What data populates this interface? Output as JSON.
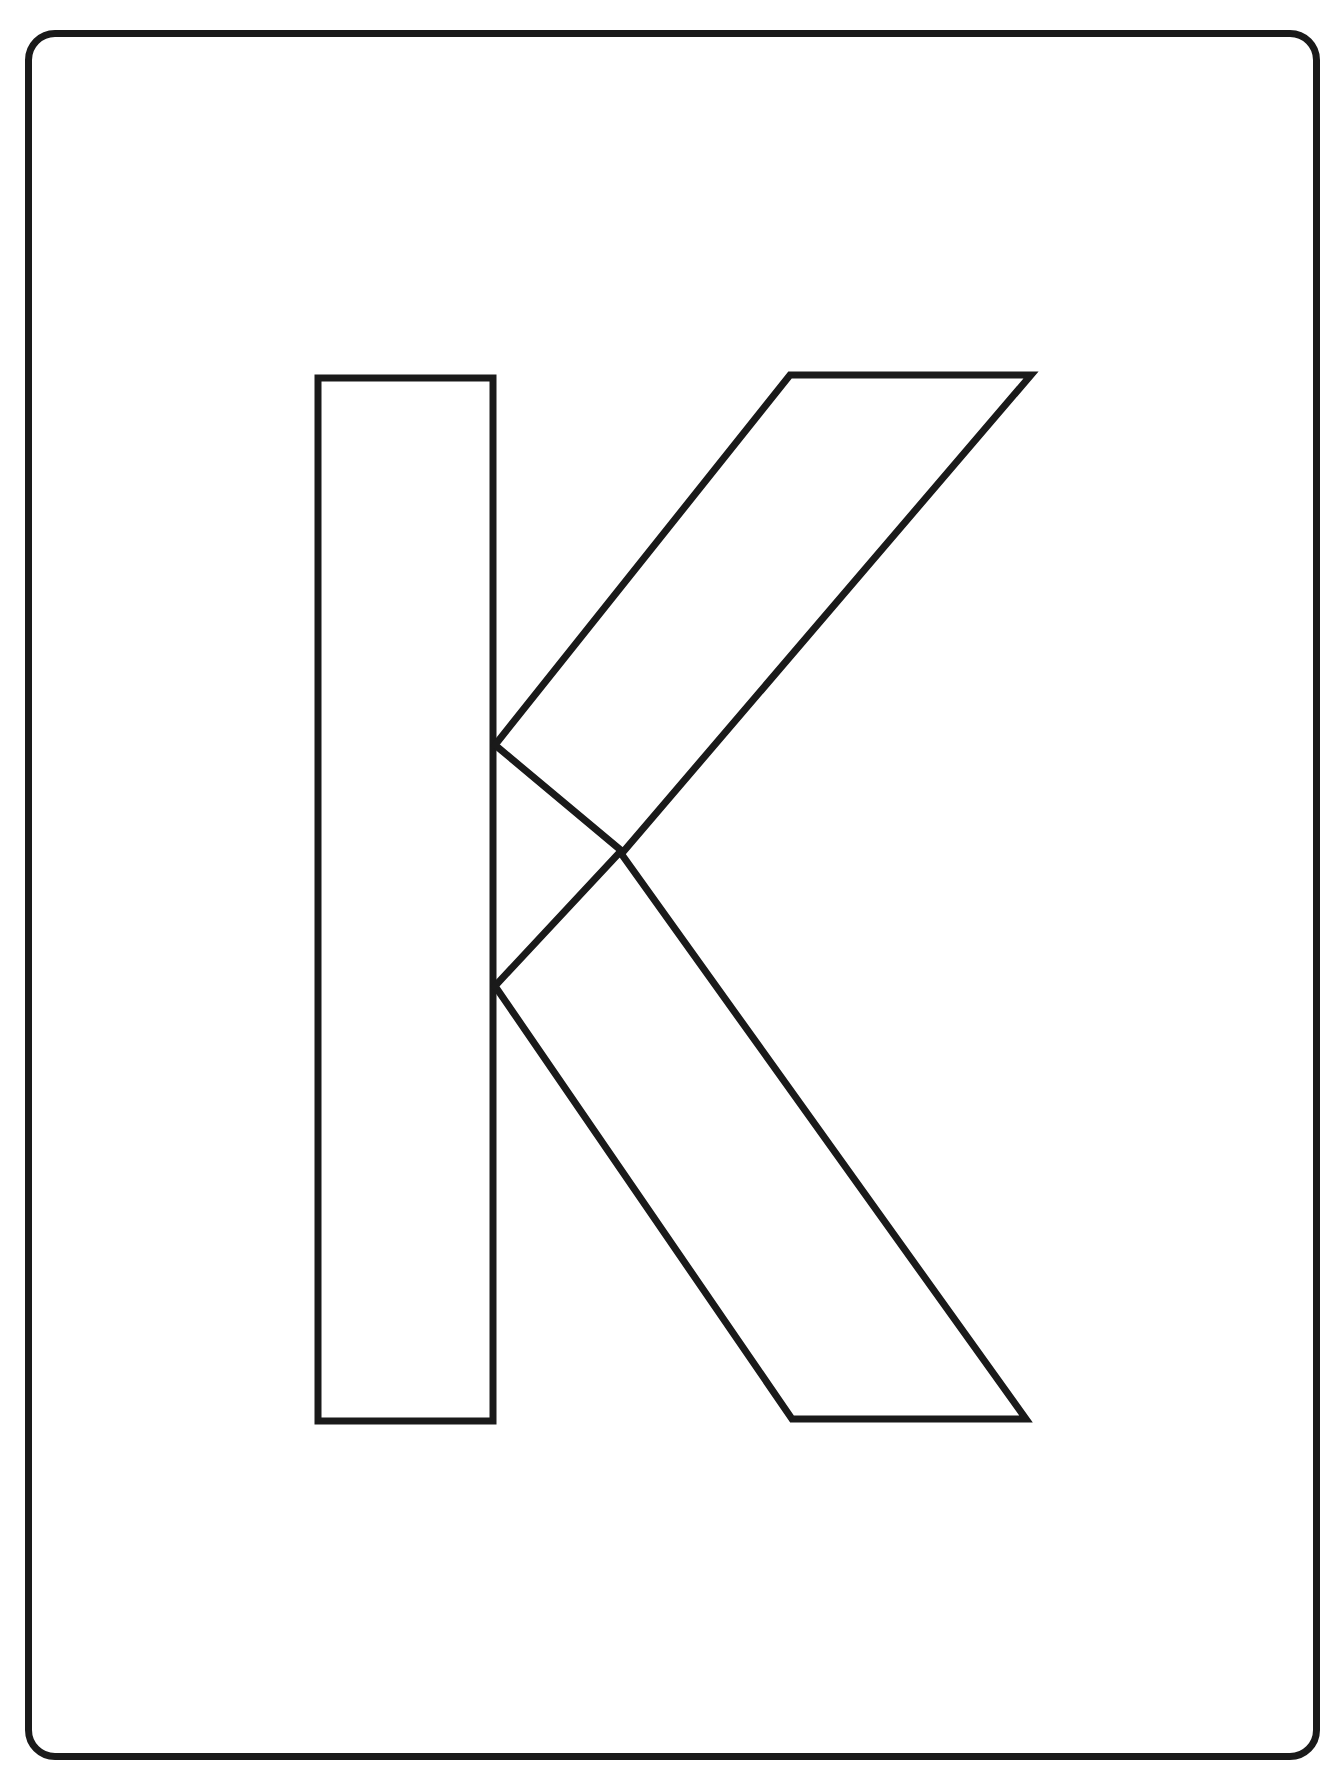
{
  "page": {
    "background_color": "#ffffff",
    "width": 1344,
    "height": 1772,
    "type": "coloring-worksheet"
  },
  "frame": {
    "name": "rounded-rectangle-border",
    "stroke_color": "#1a1a1a",
    "stroke_width": 7,
    "corner_radius": 30,
    "fill_color": "#ffffff"
  },
  "letter": {
    "character": "K",
    "case": "uppercase",
    "style": "outline",
    "fill_color": "#ffffff",
    "stroke_color": "#1a1a1a",
    "stroke_width": 7,
    "parts": [
      {
        "name": "stem",
        "label": "vertical-stem",
        "points": "318,378 493,378 493,1421 318,1421"
      },
      {
        "name": "upper-arm",
        "label": "upper-diagonal-arm",
        "points": "790,375 1031,375 623,852 495,745"
      },
      {
        "name": "lower-arm",
        "label": "lower-diagonal-leg",
        "points": "620,852 1026,1419 792,1419 495,986"
      }
    ]
  }
}
